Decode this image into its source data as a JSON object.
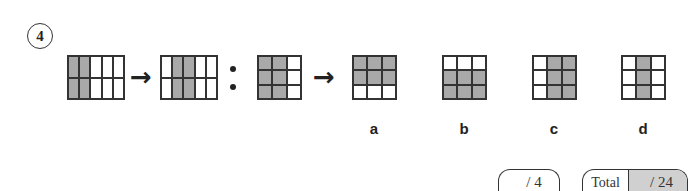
{
  "question": {
    "number": "4",
    "sequence": [
      {
        "id": "grid-1",
        "rows": 2,
        "cols": 5,
        "filled": [
          [
            1,
            1,
            0,
            0,
            0
          ],
          [
            1,
            1,
            0,
            0,
            0
          ]
        ]
      },
      {
        "id": "grid-2",
        "rows": 2,
        "cols": 5,
        "filled": [
          [
            0,
            1,
            1,
            0,
            0
          ],
          [
            0,
            1,
            1,
            0,
            0
          ]
        ]
      },
      {
        "id": "grid-3",
        "rows": 3,
        "cols": 3,
        "filled": [
          [
            1,
            1,
            0
          ],
          [
            1,
            1,
            0
          ],
          [
            1,
            1,
            0
          ]
        ]
      }
    ],
    "arrow_symbol": "→"
  },
  "options": [
    {
      "label": "a",
      "filled": [
        [
          1,
          1,
          1
        ],
        [
          1,
          1,
          1
        ],
        [
          0,
          0,
          0
        ]
      ]
    },
    {
      "label": "b",
      "filled": [
        [
          0,
          0,
          0
        ],
        [
          1,
          1,
          1
        ],
        [
          1,
          1,
          1
        ]
      ]
    },
    {
      "label": "c",
      "filled": [
        [
          0,
          1,
          1
        ],
        [
          0,
          1,
          1
        ],
        [
          0,
          1,
          1
        ]
      ]
    },
    {
      "label": "d",
      "filled": [
        [
          0,
          1,
          0
        ],
        [
          0,
          1,
          0
        ],
        [
          0,
          1,
          0
        ]
      ]
    }
  ],
  "scoring": {
    "question_score": "/ 4",
    "total_label": "Total",
    "total_score": "/ 24"
  },
  "colors": {
    "filled_cell": "#a9a9a9",
    "empty_cell": "#ffffff",
    "line": "#333333",
    "total_bg": "#d0d0d0"
  }
}
